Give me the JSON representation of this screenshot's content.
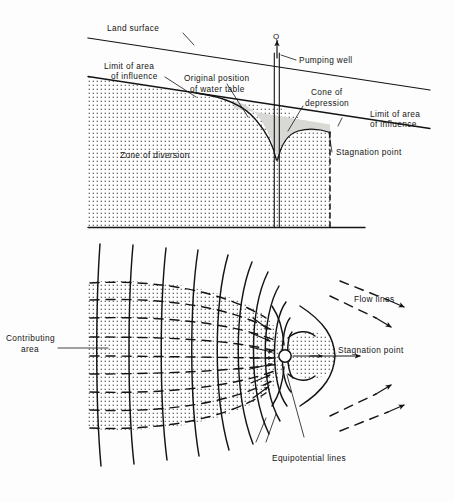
{
  "figure": {
    "background_color": "#fdfdfd",
    "ink_color": "#141414",
    "cone_fill_color": "#d8d8d4",
    "stipple_color": "#3a3a3a"
  },
  "cross_section": {
    "name": "cross-section-diagram",
    "labels": {
      "land_surface": "Land surface",
      "limit_left_line1": "Limit of area",
      "limit_left_line2": "of influence",
      "original_wt_line1": "Original position",
      "original_wt_line2": "of water table",
      "discharge": "Q",
      "pumping_well": "Pumping well",
      "cone_line1": "Cone of",
      "cone_line2": "depression",
      "limit_right_line1": "Limit of area",
      "limit_right_line2": "of influence",
      "stagnation_point": "Stagnation point",
      "zone_of_diversion": "Zone of diversion"
    }
  },
  "plan_view": {
    "name": "plan-view-flow-net",
    "labels": {
      "contributing_line1": "Contributing",
      "contributing_line2": "area",
      "flow_lines": "Flow lines",
      "stagnation_point": "Stagnation point",
      "equipotential_lines": "Equipotential lines"
    }
  }
}
